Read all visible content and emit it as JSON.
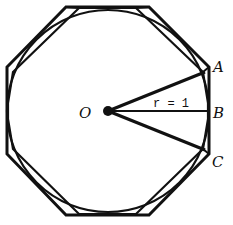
{
  "diagram": {
    "labels": {
      "center": "O",
      "point_a": "A",
      "point_b": "B",
      "point_c": "C",
      "radius": "r = 1"
    },
    "colors": {
      "stroke": "#111111",
      "background": "#ffffff"
    }
  }
}
